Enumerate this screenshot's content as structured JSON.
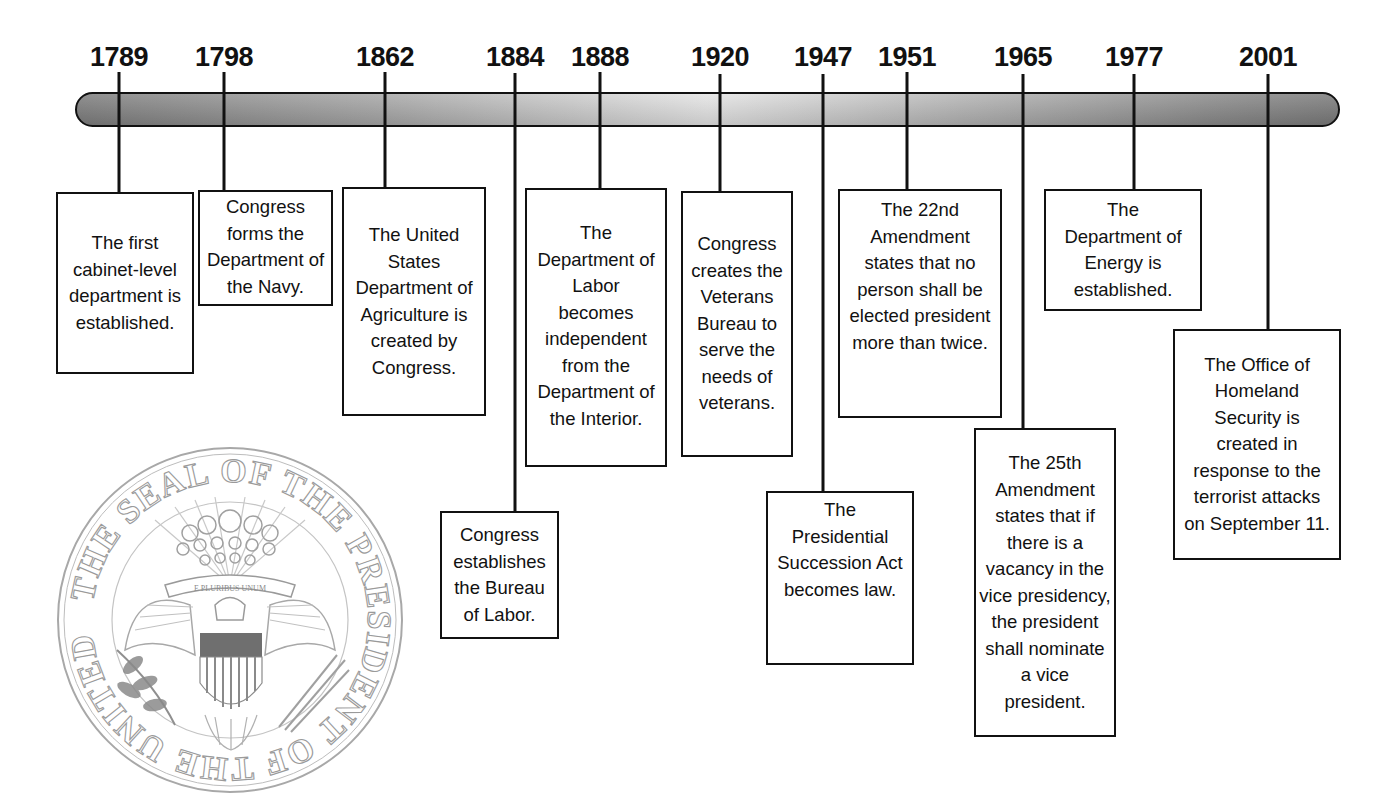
{
  "timeline": {
    "events": [
      {
        "year": "1789",
        "text": "The first cabinet-level department is established."
      },
      {
        "year": "1798",
        "text": "Congress forms the Department of the Navy."
      },
      {
        "year": "1862",
        "text": "The United States Department of Agriculture is created by Congress."
      },
      {
        "year": "1884",
        "text": "Congress establishes the Bureau of Labor."
      },
      {
        "year": "1888",
        "text": "The Department of Labor becomes independent from the Department of the Interior."
      },
      {
        "year": "1920",
        "text": "Congress creates the Veterans Bureau to serve the needs of veterans."
      },
      {
        "year": "1947",
        "text": "The Presidential Succession Act becomes law."
      },
      {
        "year": "1951",
        "text": "The 22nd Amendment states that no person shall be elected president more than twice."
      },
      {
        "year": "1965",
        "text": "The 25th Amendment states that if there is a vacancy in the vice presidency, the president shall nominate a vice president."
      },
      {
        "year": "1977",
        "text": "The Department of Energy is established."
      },
      {
        "year": "2001",
        "text": "The Office of Homeland Security is created in response to the terrorist attacks on September 11."
      }
    ]
  },
  "seal": {
    "icon": "presidential-seal-icon",
    "ring_text": "THE SEAL OF THE PRESIDENT OF THE UNITED STATES",
    "motto": "E PLURIBUS UNUM"
  },
  "colors": {
    "line": "#111111",
    "bar_dark": "#7d7d7d",
    "bar_light": "#e4e4e4",
    "seal_gray": "#9a9a9a"
  }
}
